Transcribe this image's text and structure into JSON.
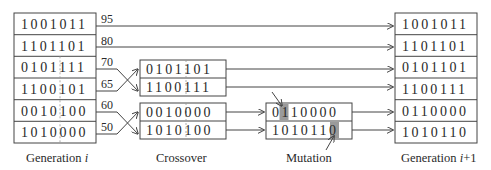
{
  "generation_i": {
    "caption_prefix": "Generation ",
    "caption_var": "i",
    "chromosomes": [
      "1001011",
      "1101101",
      "0101111",
      "1100101",
      "0010100",
      "1010000"
    ],
    "fitness": [
      "95",
      "80",
      "70",
      "65",
      "60",
      "50"
    ]
  },
  "crossover": {
    "caption": "Crossover",
    "pair1": [
      "0101101",
      "1100111"
    ],
    "pair2": [
      "0010000",
      "1010100"
    ]
  },
  "mutation": {
    "caption": "Mutation",
    "chromosomes": [
      "0110000",
      "1010110"
    ],
    "mutated_bit_index": [
      1,
      5
    ],
    "highlight_color": "#9a9a9a"
  },
  "generation_next": {
    "caption_prefix": "Generation ",
    "caption_var": "i",
    "caption_suffix": "+1",
    "chromosomes": [
      "1001011",
      "1101101",
      "0101101",
      "1100111",
      "0110000",
      "1010110"
    ]
  }
}
